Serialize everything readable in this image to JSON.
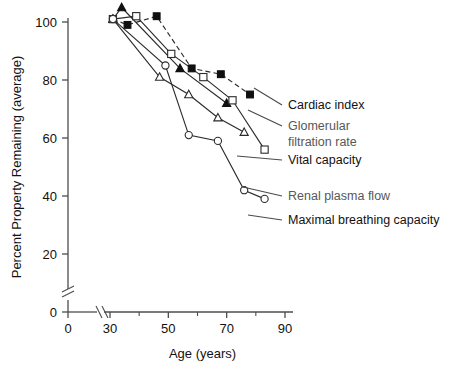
{
  "chart_data": {
    "type": "line",
    "title": "",
    "xlabel": "Age (years)",
    "ylabel": "Percent Property Remaining (average)",
    "xlim": [
      30,
      90
    ],
    "ylim": [
      0,
      105
    ],
    "xticks": [
      0,
      30,
      50,
      70,
      90
    ],
    "xticks_minor": [
      40,
      60,
      80
    ],
    "yticks": [
      0,
      20,
      40,
      60,
      80,
      100
    ],
    "axis_break_x": true,
    "axis_break_y": true,
    "grid": false,
    "legend_position": "right-inline-leaders",
    "series": [
      {
        "name": "Cardiac index",
        "marker": "filled-square",
        "linestyle": "dashed",
        "label_color": "#111111",
        "x": [
          31,
          36,
          46,
          58,
          68,
          78
        ],
        "y": [
          101,
          99,
          102,
          84,
          82,
          75
        ]
      },
      {
        "name": "Glomerular filtration rate",
        "marker": "filled-triangle",
        "linestyle": "solid",
        "label_color": "#585858",
        "x": [
          31,
          34,
          54,
          70
        ],
        "y": [
          101,
          105,
          84,
          72
        ]
      },
      {
        "name": "Vital capacity",
        "marker": "open-triangle",
        "linestyle": "solid",
        "label_color": "#111111",
        "x": [
          31,
          47,
          57,
          67,
          76
        ],
        "y": [
          101,
          81,
          75,
          67,
          62
        ]
      },
      {
        "name": "Renal plasma flow",
        "marker": "open-square",
        "linestyle": "solid",
        "label_color": "#585858",
        "x": [
          31,
          39,
          51,
          62,
          72,
          83
        ],
        "y": [
          101,
          102,
          89,
          81,
          73,
          56
        ]
      },
      {
        "name": "Maximal breathing capacity",
        "marker": "open-circle",
        "linestyle": "solid",
        "label_color": "#111111",
        "x": [
          31,
          49,
          57,
          67,
          76,
          83
        ],
        "y": [
          101,
          85,
          61,
          59,
          42,
          39
        ]
      }
    ],
    "annotations": [
      {
        "text": "Cardiac index",
        "series": "Cardiac index"
      },
      {
        "text": "Glomerular",
        "series": "Glomerular filtration rate"
      },
      {
        "text": "filtration rate",
        "series": "Glomerular filtration rate"
      },
      {
        "text": "Vital capacity",
        "series": "Vital capacity"
      },
      {
        "text": "Renal plasma flow",
        "series": "Renal plasma flow"
      },
      {
        "text": "Maximal breathing capacity",
        "series": "Maximal breathing capacity"
      }
    ]
  },
  "legend": {
    "items": [
      {
        "label": "Cardiac index",
        "grey": false
      },
      {
        "label": "Glomerular",
        "grey": true
      },
      {
        "label": "filtration rate",
        "grey": true
      },
      {
        "label": "Vital capacity",
        "grey": false
      },
      {
        "label": "Renal plasma flow",
        "grey": true
      },
      {
        "label": "Maximal breathing capacity",
        "grey": false
      }
    ]
  },
  "axes": {
    "x_title": "Age (years)",
    "y_title": "Percent Property Remaining (average)",
    "x_tick_labels": [
      "0",
      "30",
      "50",
      "70",
      "90"
    ],
    "y_tick_labels": [
      "0",
      "20",
      "40",
      "60",
      "80",
      "100"
    ]
  }
}
